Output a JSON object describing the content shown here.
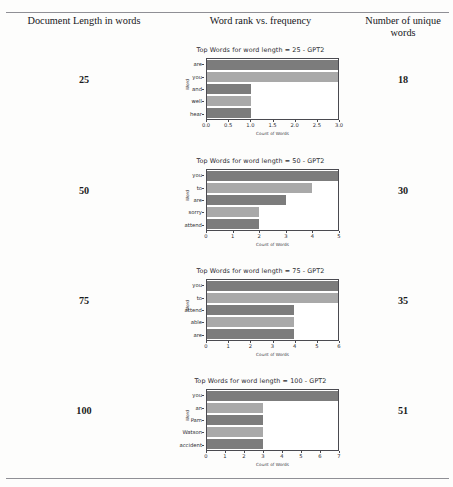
{
  "table": {
    "headers": {
      "left": "Document Length in words",
      "middle": "Word rank vs. frequency",
      "right": "Number of unique words"
    },
    "rows": [
      {
        "doc_length": "25",
        "unique_words": "18"
      },
      {
        "doc_length": "50",
        "unique_words": "30"
      },
      {
        "doc_length": "75",
        "unique_words": "35"
      },
      {
        "doc_length": "100",
        "unique_words": "51"
      }
    ]
  },
  "colors": {
    "bar_dark": "#7c7c7c",
    "bar_light": "#a9a9a9",
    "axis": "#4a4a50",
    "rule": "#8f8f95",
    "text": "#1c1c20"
  },
  "chart_data": [
    {
      "type": "bar",
      "orientation": "horizontal",
      "title": "Top Words for word length = 25 - GPT2",
      "xlabel": "Count of Words",
      "ylabel": "Word",
      "categories": [
        "are",
        "you",
        "and",
        "well",
        "hear"
      ],
      "values": [
        3.0,
        3.0,
        1.0,
        1.0,
        1.0
      ],
      "xlim": [
        0.0,
        3.0
      ],
      "xticks": [
        "0.0",
        "0.5",
        "1.0",
        "1.5",
        "2.0",
        "2.5",
        "3.0"
      ],
      "xtick_values": [
        0.0,
        0.5,
        1.0,
        1.5,
        2.0,
        2.5,
        3.0
      ],
      "grid": false,
      "legend": "none"
    },
    {
      "type": "bar",
      "orientation": "horizontal",
      "title": "Top Words for word length = 50 - GPT2",
      "xlabel": "Count of Words",
      "ylabel": "Word",
      "categories": [
        "you",
        "to",
        "are",
        "sorry",
        "attend"
      ],
      "values": [
        5,
        4,
        3,
        2,
        2
      ],
      "xlim": [
        0,
        5
      ],
      "xticks": [
        "0",
        "1",
        "2",
        "3",
        "4",
        "5"
      ],
      "xtick_values": [
        0,
        1,
        2,
        3,
        4,
        5
      ],
      "grid": false,
      "legend": "none"
    },
    {
      "type": "bar",
      "orientation": "horizontal",
      "title": "Top Words for word length = 75 - GPT2",
      "xlabel": "Count of Words",
      "ylabel": "Word",
      "categories": [
        "you",
        "to",
        "attend",
        "able",
        "are"
      ],
      "values": [
        6,
        6,
        4,
        4,
        4
      ],
      "xlim": [
        0,
        6
      ],
      "xticks": [
        "0",
        "1",
        "2",
        "3",
        "4",
        "5",
        "6"
      ],
      "xtick_values": [
        0,
        1,
        2,
        3,
        4,
        5,
        6
      ],
      "grid": false,
      "legend": "none"
    },
    {
      "type": "bar",
      "orientation": "horizontal",
      "title": "Top Words for word length = 100 - GPT2",
      "xlabel": "Count of Words",
      "ylabel": "Word",
      "categories": [
        "you",
        "an",
        "Pam",
        "Watson",
        "accident"
      ],
      "values": [
        7,
        3,
        3,
        3,
        3
      ],
      "xlim": [
        0,
        7
      ],
      "xticks": [
        "0",
        "1",
        "2",
        "3",
        "4",
        "5",
        "6",
        "7"
      ],
      "xtick_values": [
        0,
        1,
        2,
        3,
        4,
        5,
        6,
        7
      ],
      "grid": false,
      "legend": "none"
    }
  ]
}
